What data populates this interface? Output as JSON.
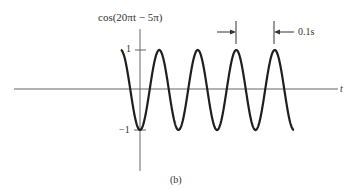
{
  "chart_data": {
    "type": "line",
    "title": "",
    "function": "cos(20πt − 5π)",
    "xlabel": "t",
    "ylabel": "cos(20πt − 5π)",
    "yticks": [
      {
        "value": 1,
        "label": "1"
      },
      {
        "value": -1,
        "label": "−1"
      }
    ],
    "ylim": [
      -1,
      1
    ],
    "period_s": 0.1,
    "period_annotation": "0.1s",
    "caption": "(b)",
    "grid": false,
    "legend": null,
    "series": [
      {
        "name": "cos(20πt − 5π)",
        "description": "Sinusoid of amplitude 1, period 0.1 s; value −1 at t = 0; starts at +1 at t = −0.05 s and ends at −1 at t = 0.4 s",
        "t_range": [
          -0.05,
          0.4
        ],
        "points": [
          {
            "t": -0.05,
            "y": 1
          },
          {
            "t": 0.0,
            "y": -1
          },
          {
            "t": 0.05,
            "y": 1
          },
          {
            "t": 0.1,
            "y": -1
          },
          {
            "t": 0.15,
            "y": 1
          },
          {
            "t": 0.2,
            "y": -1
          },
          {
            "t": 0.25,
            "y": 1
          },
          {
            "t": 0.3,
            "y": -1
          },
          {
            "t": 0.35,
            "y": 1
          },
          {
            "t": 0.4,
            "y": -1
          }
        ]
      }
    ]
  },
  "labels": {
    "ylabel": "cos(20πt − 5π)",
    "ytick_pos": "1",
    "ytick_neg": "−1",
    "xlabel": "t",
    "period": "0.1s",
    "caption": "(b)"
  },
  "colors": {
    "curve": "#1e1e1e",
    "axis": "#555555"
  }
}
